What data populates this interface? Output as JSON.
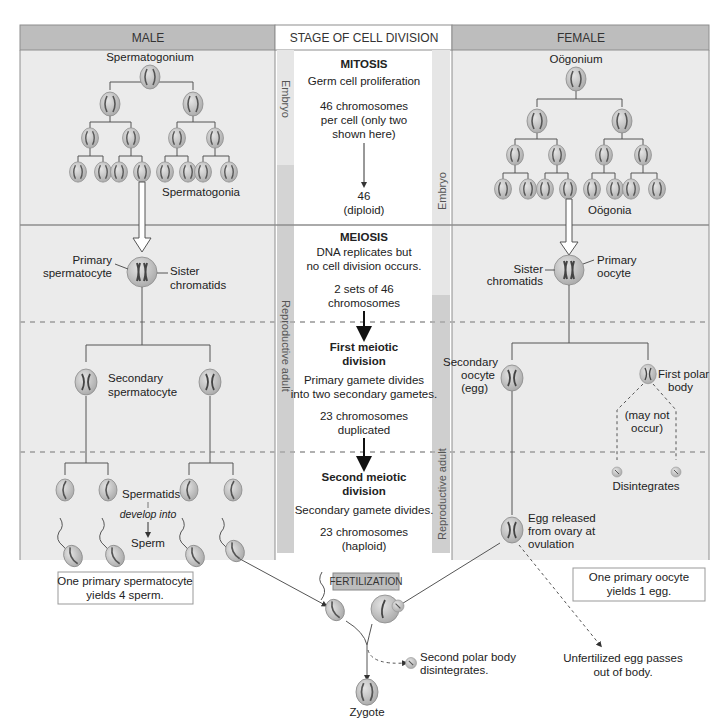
{
  "header": {
    "male": "MALE",
    "stage": "STAGE OF CELL DIVISION",
    "female": "FEMALE"
  },
  "side_labels": {
    "embryo_left": "Embryo",
    "embryo_right": "Embryo",
    "adult_left": "Reproductive adult",
    "adult_right": "Reproductive adult"
  },
  "center": {
    "mitosis_title": "MITOSIS",
    "mitosis_sub": "Germ cell proliferation",
    "mitosis_chrom_1": "46 chromosomes",
    "mitosis_chrom_2": "per cell (only two",
    "mitosis_chrom_3": "shown here)",
    "diploid_1": "46",
    "diploid_2": "(diploid)",
    "meiosis_title": "MEIOSIS",
    "meiosis_sub_1": "DNA replicates but",
    "meiosis_sub_2": "no cell division occurs.",
    "sets_1": "2 sets of 46",
    "sets_2": "chromosomes",
    "first_div_1": "First meiotic",
    "first_div_2": "division",
    "first_desc_1": "Primary gamete divides",
    "first_desc_2": "into two secondary gametes.",
    "dup_1": "23 chromosomes",
    "dup_2": "duplicated",
    "second_div_1": "Second meiotic",
    "second_div_2": "division",
    "second_desc": "Secondary gamete divides.",
    "haploid_1": "23 chromosomes",
    "haploid_2": "(haploid)"
  },
  "male": {
    "spermatogonium": "Spermatogonium",
    "spermatogonia": "Spermatogonia",
    "primary_1": "Primary",
    "primary_2": "spermatocyte",
    "sister_1": "Sister",
    "sister_2": "chromatids",
    "secondary_1": "Secondary",
    "secondary_2": "spermatocyte",
    "spermatids": "Spermatids",
    "develop": "develop into",
    "sperm": "Sperm",
    "summary_1": "One primary spermatocyte",
    "summary_2": "yields 4 sperm."
  },
  "female": {
    "oogonium": "Oögonium",
    "oogonia": "Oögonia",
    "primary_1": "Primary",
    "primary_2": "oocyte",
    "sister_1": "Sister",
    "sister_2": "chromatids",
    "secondary_1": "Secondary",
    "secondary_2": "oocyte",
    "secondary_3": "(egg)",
    "polar_1": "First polar",
    "polar_2": "body",
    "maynot_1": "(may not",
    "maynot_2": "occur)",
    "disintegrates": "Disintegrates",
    "egg_1": "Egg released",
    "egg_2": "from ovary at",
    "egg_3": "ovulation",
    "summary_1": "One primary oocyte",
    "summary_2": "yields 1 egg."
  },
  "bottom": {
    "fertilization": "FERTILIZATION",
    "second_polar_1": "Second polar body",
    "second_polar_2": "disintegrates.",
    "unfert_1": "Unfertilized egg passes",
    "unfert_2": "out of body.",
    "zygote": "Zygote"
  },
  "colors": {
    "header_gray": "#bdbdbd",
    "panel_gray": "#ebebeb",
    "side_bar": "#cfcfcf",
    "cell_fill": "#b9b9b9",
    "chromosome": "#555555"
  }
}
